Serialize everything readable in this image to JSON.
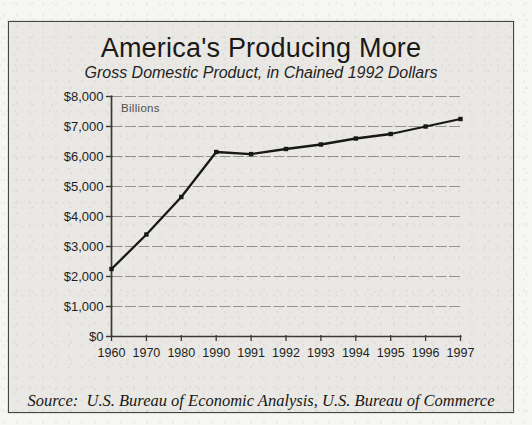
{
  "panel": {
    "title": "America's Producing More",
    "subtitle": "Gross Domestic Product, in Chained 1992 Dollars",
    "source": "Source:  U.S. Bureau of Economic Analysis, U.S. Bureau of Commerce"
  },
  "chart_data": {
    "type": "line",
    "title": "America's Producing More",
    "subtitle": "Gross Domestic Product, in Chained 1992 Dollars",
    "unit_label": "Billions",
    "series_name": "Gross Domestic Product, chained 1992 dollars (billions)",
    "categories": [
      "1960",
      "1970",
      "1980",
      "1990",
      "1991",
      "1992",
      "1993",
      "1994",
      "1995",
      "1996",
      "1997"
    ],
    "values": [
      2250,
      3400,
      4650,
      6150,
      6080,
      6250,
      6400,
      6600,
      6750,
      7000,
      7250
    ],
    "ylim": [
      0,
      8000
    ],
    "y_tick_values": [
      0,
      1000,
      2000,
      3000,
      4000,
      5000,
      6000,
      7000,
      8000
    ],
    "y_tick_labels": [
      "$0",
      "$1,000",
      "$2,000",
      "$3,000",
      "$4,000",
      "$5,000",
      "$6,000",
      "$7,000",
      "$8,000"
    ],
    "grid": true,
    "legend_position": "none",
    "marker": "square",
    "line_color": "#171715",
    "grid_color": "#8b8a83",
    "axis_color": "#3a3935"
  },
  "colors": {
    "paper": "#e9e8e4",
    "page_margin": "#f6f6f3",
    "panel_border": "#45443f",
    "text": "#1e1e1c",
    "unit_label_text": "#504f49"
  }
}
